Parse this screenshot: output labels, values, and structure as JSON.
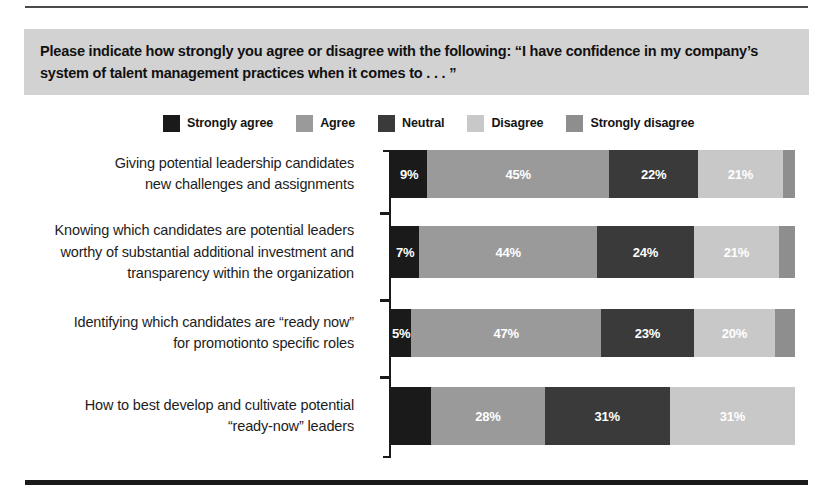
{
  "chart_data": {
    "type": "bar",
    "subtype": "stacked-horizontal-100pct",
    "title": "Please indicate how strongly you agree or disagree with the following: “I have confidence in my company’s system of talent management practices when it comes to . . . ”",
    "xlabel": "",
    "ylabel": "",
    "xlim": [
      0,
      100
    ],
    "grid": false,
    "legend_position": "top-center",
    "value_suffix": "%",
    "categories": [
      "Giving potential leadership candidates new challenges and assignments",
      "Knowing which candidates are potential leaders worthy of substantial additional investment and transparency within the organization",
      "Identifying which candidates are “ready now” for promotionto specific roles",
      "How to best develop and cultivate potential “ready-now” leaders"
    ],
    "series": [
      {
        "name": "Strongly agree",
        "color": "#1a1a1a",
        "text_color": "#ffffff",
        "values": [
          9,
          7,
          5,
          10
        ],
        "labels": [
          "9%",
          "7%",
          "5%",
          ""
        ]
      },
      {
        "name": "Agree",
        "color": "#9a9a9a",
        "text_color": "#ffffff",
        "values": [
          45,
          44,
          47,
          28
        ],
        "labels": [
          "45%",
          "44%",
          "47%",
          "28%"
        ]
      },
      {
        "name": "Neutral",
        "color": "#3a3a3a",
        "text_color": "#ffffff",
        "values": [
          22,
          24,
          23,
          31
        ],
        "labels": [
          "22%",
          "24%",
          "23%",
          "31%"
        ]
      },
      {
        "name": "Disagree",
        "color": "#c8c8c8",
        "text_color": "#ffffff",
        "values": [
          21,
          21,
          20,
          31
        ],
        "labels": [
          "21%",
          "21%",
          "20%",
          "31%"
        ]
      },
      {
        "name": "Strongly disagree",
        "color": "#8e8e8e",
        "text_color": "#ffffff",
        "values": [
          3,
          4,
          5,
          0
        ],
        "labels": [
          "",
          "",
          "",
          ""
        ]
      }
    ]
  },
  "legend": {
    "items": [
      {
        "label": "Strongly agree",
        "color": "#1a1a1a"
      },
      {
        "label": "Agree",
        "color": "#9a9a9a"
      },
      {
        "label": "Neutral",
        "color": "#3a3a3a"
      },
      {
        "label": "Disagree",
        "color": "#c8c8c8"
      },
      {
        "label": "Strongly disagree",
        "color": "#8e8e8e"
      }
    ]
  },
  "rows": [
    {
      "label": "Giving potential leadership candidates new challenges and assignments",
      "label_lines": [
        "Giving potential leadership candidates",
        "new challenges and assignments"
      ],
      "segments": [
        {
          "series": "Strongly agree",
          "value": 9,
          "label": "9%"
        },
        {
          "series": "Agree",
          "value": 45,
          "label": "45%"
        },
        {
          "series": "Neutral",
          "value": 22,
          "label": "22%"
        },
        {
          "series": "Disagree",
          "value": 21,
          "label": "21%"
        },
        {
          "series": "Strongly disagree",
          "value": 3,
          "label": ""
        }
      ]
    },
    {
      "label": "Knowing which candidates are potential leaders worthy of substantial additional investment and transparency within the organization",
      "label_lines": [
        "Knowing which candidates are potential leaders",
        "worthy of substantial additional investment and",
        "transparency within the organization"
      ],
      "segments": [
        {
          "series": "Strongly agree",
          "value": 7,
          "label": "7%"
        },
        {
          "series": "Agree",
          "value": 44,
          "label": "44%"
        },
        {
          "series": "Neutral",
          "value": 24,
          "label": "24%"
        },
        {
          "series": "Disagree",
          "value": 21,
          "label": "21%"
        },
        {
          "series": "Strongly disagree",
          "value": 4,
          "label": ""
        }
      ]
    },
    {
      "label": "Identifying which candidates are “ready now” for promotionto specific roles",
      "label_lines": [
        "Identifying which candidates are “ready now”",
        "for promotionto specific roles"
      ],
      "segments": [
        {
          "series": "Strongly agree",
          "value": 5,
          "label": "5%"
        },
        {
          "series": "Agree",
          "value": 47,
          "label": "47%"
        },
        {
          "series": "Neutral",
          "value": 23,
          "label": "23%"
        },
        {
          "series": "Disagree",
          "value": 20,
          "label": "20%"
        },
        {
          "series": "Strongly disagree",
          "value": 5,
          "label": ""
        }
      ]
    },
    {
      "label": "How to best develop and cultivate potential “ready-now” leaders",
      "label_lines": [
        "How to best develop and cultivate potential",
        "“ready-now” leaders"
      ],
      "segments": [
        {
          "series": "Strongly agree",
          "value": 10,
          "label": ""
        },
        {
          "series": "Agree",
          "value": 28,
          "label": "28%"
        },
        {
          "series": "Neutral",
          "value": 31,
          "label": "31%"
        },
        {
          "series": "Disagree",
          "value": 31,
          "label": "31%"
        },
        {
          "series": "Strongly disagree",
          "value": 0,
          "label": ""
        }
      ]
    }
  ],
  "colors": {
    "title_band_background": "#d2d2d2",
    "page_background": "#ffffff",
    "axis": "#1a1a1a",
    "rule_top": "#4a4a4a",
    "rule_bottom": "#1a1a1a"
  }
}
